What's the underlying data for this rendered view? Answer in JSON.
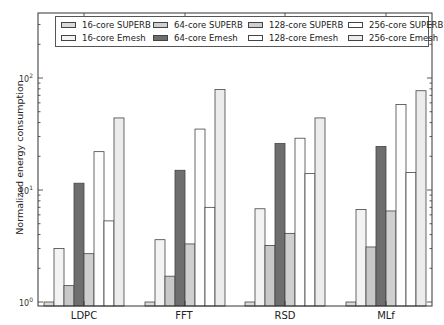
{
  "chart_data": {
    "type": "bar",
    "title": "",
    "xlabel": "",
    "ylabel": "Normalized energy consumption",
    "yscale": "log",
    "ylim": [
      0.97,
      170
    ],
    "yticks": [
      "10^0",
      "10^1",
      "10^2"
    ],
    "categories": [
      "LDPC",
      "FFT",
      "RSD",
      "MLf"
    ],
    "legend_position": "top (inside, 4 columns)",
    "grid": false,
    "series": [
      {
        "name": "16-core SUPERB",
        "color": "#d9d9d9",
        "values": [
          1.0,
          1.0,
          1.0,
          1.0
        ]
      },
      {
        "name": "16-core Emesh",
        "color": "#f3f3f3",
        "values": [
          3.0,
          3.6,
          6.8,
          6.7
        ]
      },
      {
        "name": "64-core SUPERB",
        "color": "#c8c8c8",
        "values": [
          1.4,
          1.7,
          3.2,
          3.1
        ]
      },
      {
        "name": "64-core Emesh",
        "color": "#6e6e6e",
        "values": [
          11.5,
          15.0,
          26.0,
          24.5
        ]
      },
      {
        "name": "128-core SUPERB",
        "color": "#cfcfcf",
        "values": [
          2.7,
          3.3,
          4.1,
          6.5
        ]
      },
      {
        "name": "128-core Emesh",
        "color": "#fdfdfd",
        "values": [
          22.0,
          35.0,
          29.0,
          58.0
        ]
      },
      {
        "name": "256-core SUPERB",
        "color": "#ffffff",
        "values": [
          5.3,
          7.0,
          14.0,
          14.3
        ]
      },
      {
        "name": "256-core Emesh",
        "color": "#ececec",
        "values": [
          44.0,
          79.0,
          44.0,
          77.0
        ]
      }
    ]
  },
  "legend": {
    "items": [
      {
        "label": "16-core SUPERB",
        "color": "#d9d9d9"
      },
      {
        "label": "64-core SUPERB",
        "color": "#cfcfcf"
      },
      {
        "label": "128-core SUPERB",
        "color": "#cfcfcf"
      },
      {
        "label": "256-core SUPERB",
        "color": "#ffffff"
      },
      {
        "label": "16-core Emesh",
        "color": "#f3f3f3"
      },
      {
        "label": "64-core Emesh",
        "color": "#6e6e6e"
      },
      {
        "label": "128-core Emesh",
        "color": "#ffffff"
      },
      {
        "label": "256-core Emesh",
        "color": "#ececec"
      }
    ]
  },
  "axis": {
    "ylabel": "Normalized energy consumption",
    "ytick_base": "10",
    "ytick_exps": [
      "0",
      "1",
      "2"
    ]
  }
}
